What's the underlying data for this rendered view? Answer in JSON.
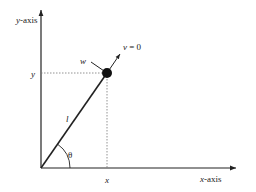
{
  "diagram": {
    "axes": {
      "x_label": "x-axis",
      "y_label": "y-axis"
    },
    "labels": {
      "x_coord": "x",
      "y_coord": "y",
      "length": "l",
      "angle": "θ",
      "w": "w",
      "v_eq": "v = 0"
    },
    "colors": {
      "line": "#222222",
      "dotted": "#777777",
      "ball": "#111111",
      "background": "#ffffff"
    }
  }
}
